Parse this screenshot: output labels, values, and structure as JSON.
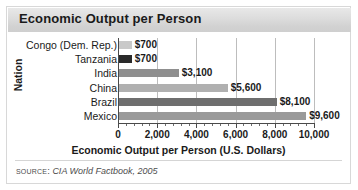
{
  "figure": {
    "title": "Economic Output per Person",
    "source_prefix": "Source:",
    "source_reference": "CIA World Factbook, 2005"
  },
  "chart_data": {
    "type": "bar",
    "orientation": "horizontal",
    "title": "Economic Output per Person",
    "xlabel": "Economic Output per Person (U.S. Dollars)",
    "ylabel": "Nation",
    "categories": [
      "Congo (Dem. Rep.)",
      "Tanzania",
      "India",
      "China",
      "Brazil",
      "Mexico"
    ],
    "values": [
      700,
      700,
      3100,
      5600,
      8100,
      9600
    ],
    "value_labels": [
      "$700",
      "$700",
      "$3,100",
      "$5,600",
      "$8,100",
      "$9,600"
    ],
    "bar_colors": [
      "#c9c9c9",
      "#2a2a2a",
      "#8f8f8f",
      "#b0b0b0",
      "#6e6e6e",
      "#9a9a9a"
    ],
    "xlim": [
      0,
      10000
    ],
    "xticks": [
      0,
      2000,
      4000,
      6000,
      8000,
      10000
    ],
    "xtick_labels": [
      "0",
      "2,000",
      "4,000",
      "6,000",
      "8,000",
      "10,000"
    ],
    "grid": "vertical",
    "minor_ticks_per_interval": 4,
    "legend": "none"
  }
}
